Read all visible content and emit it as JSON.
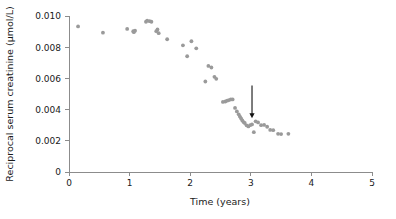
{
  "chart_data": {
    "type": "scatter",
    "title": "",
    "xlabel": "Time (years)",
    "ylabel": "Reciprocal serum creatinine (μmol/L)",
    "xlim": [
      0,
      5
    ],
    "ylim": [
      0,
      0.01
    ],
    "xticks": [
      0,
      1,
      2,
      3,
      4,
      5
    ],
    "xticklabels": [
      "0",
      "1",
      "2",
      "3",
      "4",
      "5"
    ],
    "yticks": [
      0,
      0.002,
      0.004,
      0.006,
      0.008,
      0.01
    ],
    "yticklabels": [
      "0",
      "0.002",
      "0.004",
      "0.006",
      "0.008",
      "0.010"
    ],
    "grid": false,
    "legend": null,
    "marker_color": "#9a9a9a",
    "axis_color": "#8c8c8c",
    "series": [
      {
        "name": "Reciprocal serum creatinine",
        "x": [
          0.15,
          0.56,
          0.96,
          1.06,
          1.07,
          1.09,
          1.27,
          1.29,
          1.33,
          1.36,
          1.44,
          1.46,
          1.48,
          1.62,
          1.88,
          1.95,
          2.02,
          2.1,
          2.25,
          2.3,
          2.35,
          2.4,
          2.43,
          2.54,
          2.58,
          2.61,
          2.64,
          2.67,
          2.7,
          2.74,
          2.77,
          2.8,
          2.82,
          2.84,
          2.86,
          2.88,
          2.9,
          2.93,
          2.96,
          2.99,
          3.02,
          3.05,
          3.08,
          3.12,
          3.17,
          3.22,
          3.27,
          3.32,
          3.37,
          3.45,
          3.5,
          3.62
        ],
        "y": [
          0.00933,
          0.00893,
          0.00917,
          0.00903,
          0.00896,
          0.00906,
          0.00963,
          0.0097,
          0.00967,
          0.00963,
          0.00903,
          0.00914,
          0.0089,
          0.00851,
          0.00812,
          0.00742,
          0.00838,
          0.00793,
          0.0058,
          0.0068,
          0.0067,
          0.0061,
          0.00597,
          0.00449,
          0.00452,
          0.00457,
          0.00461,
          0.00465,
          0.00465,
          0.00411,
          0.00388,
          0.0037,
          0.00355,
          0.00343,
          0.0033,
          0.0032,
          0.00314,
          0.00299,
          0.00292,
          0.003,
          0.00305,
          0.00255,
          0.00325,
          0.00318,
          0.003,
          0.00302,
          0.0029,
          0.0027,
          0.00268,
          0.00245,
          0.00243,
          0.00245
        ]
      }
    ],
    "annotations": [
      {
        "name": "event-arrow",
        "type": "arrow",
        "x": 3.02,
        "y_tail": 0.00555,
        "y_head": 0.00345,
        "direction": "down",
        "color": "#111111",
        "label": ""
      }
    ]
  }
}
